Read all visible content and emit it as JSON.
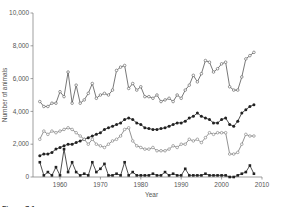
{
  "chart_data": {
    "type": "line",
    "title": "",
    "xlabel": "Year",
    "ylabel": "Number of animals",
    "xlim": [
      1953,
      2010
    ],
    "ylim": [
      0,
      10000
    ],
    "xticks": [
      1960,
      1970,
      1980,
      1990,
      2000,
      2010
    ],
    "xtick_labels": [
      "1960",
      "1970",
      "1980",
      "1990",
      "2000",
      "2010"
    ],
    "yticks": [
      0,
      2000,
      4000,
      6000,
      8000,
      10000
    ],
    "ytick_labels": [
      "0",
      "2,000",
      "4,000",
      "6,000",
      "8,000",
      "10,000"
    ],
    "grid": false,
    "legend": null,
    "x": [
      1955,
      1956,
      1957,
      1958,
      1959,
      1960,
      1961,
      1962,
      1963,
      1964,
      1965,
      1966,
      1967,
      1968,
      1969,
      1970,
      1971,
      1972,
      1973,
      1974,
      1975,
      1976,
      1977,
      1978,
      1979,
      1980,
      1981,
      1982,
      1983,
      1984,
      1985,
      1986,
      1987,
      1988,
      1989,
      1990,
      1991,
      1992,
      1993,
      1994,
      1995,
      1996,
      1997,
      1998,
      1999,
      2000,
      2001,
      2002,
      2003,
      2004,
      2005,
      2006,
      2007,
      2008
    ],
    "series": [
      {
        "name": "Series A (open circles, upper)",
        "marker": "open-circle",
        "color": "#555555",
        "values": [
          4600,
          4300,
          4300,
          4500,
          4500,
          5200,
          4900,
          6400,
          4500,
          5600,
          4500,
          4700,
          5100,
          5700,
          4800,
          5000,
          5100,
          5000,
          5300,
          6500,
          6700,
          6800,
          5400,
          5700,
          5300,
          5500,
          4900,
          4900,
          4800,
          5000,
          4600,
          4700,
          4800,
          4600,
          5000,
          4800,
          5300,
          5600,
          6200,
          5800,
          6300,
          7100,
          7000,
          6400,
          6600,
          6900,
          7000,
          5500,
          5300,
          5300,
          6100,
          7200,
          7400,
          7600
        ]
      },
      {
        "name": "Series B (filled circles, rising)",
        "marker": "filled-circle",
        "color": "#222222",
        "values": [
          1300,
          1400,
          1400,
          1500,
          1700,
          1800,
          1900,
          2000,
          2000,
          2100,
          2200,
          2300,
          2400,
          2500,
          2600,
          2700,
          2900,
          3000,
          3100,
          3200,
          3300,
          3500,
          3600,
          3500,
          3300,
          3200,
          3000,
          2950,
          2900,
          2900,
          2950,
          3000,
          3100,
          3200,
          3300,
          3300,
          3400,
          3600,
          3700,
          3900,
          3700,
          3600,
          3500,
          3300,
          3300,
          3500,
          3600,
          3200,
          3100,
          3400,
          3900,
          4100,
          4300,
          4400
        ]
      },
      {
        "name": "Series C (open circles, lower)",
        "marker": "open-circle",
        "color": "#777777",
        "values": [
          2300,
          2800,
          2600,
          2800,
          2700,
          2800,
          2900,
          3000,
          2900,
          2700,
          2500,
          2300,
          2000,
          2300,
          2000,
          1900,
          1800,
          2000,
          2200,
          2300,
          2500,
          2900,
          3000,
          2200,
          1900,
          1800,
          1700,
          1700,
          1800,
          1600,
          1600,
          1600,
          1700,
          1900,
          1800,
          2000,
          2000,
          2300,
          2200,
          2300,
          2100,
          2400,
          2700,
          2600,
          2700,
          2700,
          2700,
          1400,
          1400,
          1500,
          2000,
          2600,
          2500,
          2500
        ]
      },
      {
        "name": "Series D (filled squares, bottom)",
        "marker": "filled-square",
        "color": "#222222",
        "values": [
          900,
          100,
          300,
          100,
          600,
          100,
          1700,
          300,
          900,
          300,
          100,
          200,
          100,
          900,
          300,
          500,
          800,
          100,
          100,
          200,
          100,
          900,
          100,
          300,
          100,
          100,
          100,
          100,
          200,
          100,
          100,
          300,
          100,
          200,
          100,
          100,
          500,
          100,
          100,
          100,
          100,
          200,
          100,
          100,
          100,
          100,
          100,
          0,
          0,
          100,
          200,
          300,
          700,
          200
        ]
      }
    ],
    "caption": "Figure 7.1"
  }
}
